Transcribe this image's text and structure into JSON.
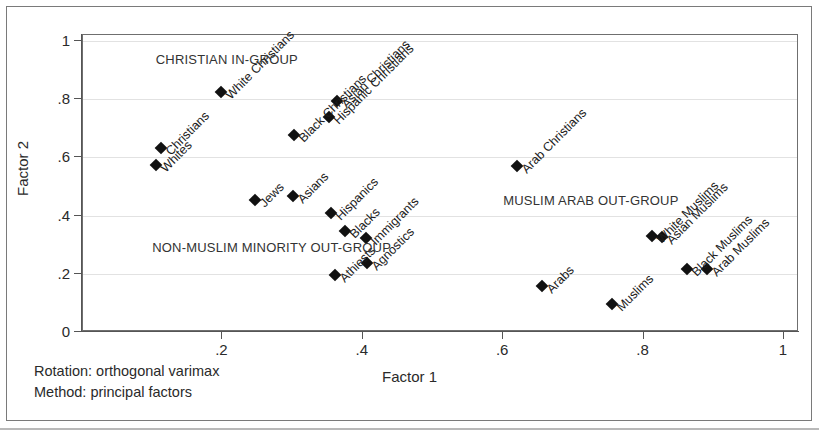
{
  "chart_data": {
    "type": "scatter",
    "title": "",
    "xlabel": "Factor 1",
    "ylabel": "Factor 2",
    "xlim": [
      0,
      1.02
    ],
    "ylim": [
      0,
      1.02
    ],
    "xticks": [
      "",
      ".2",
      ".4",
      ".6",
      ".8",
      "1"
    ],
    "xtick_values": [
      0,
      0.2,
      0.4,
      0.6,
      0.8,
      1
    ],
    "yticks": [
      "0",
      ".2",
      ".4",
      ".6",
      ".8",
      "1"
    ],
    "ytick_values": [
      0,
      0.2,
      0.4,
      0.6,
      0.8,
      1
    ],
    "grid": true,
    "legend": "none",
    "points": [
      {
        "label": "Christians",
        "x": 0.112,
        "y": 0.632
      },
      {
        "label": "Whites",
        "x": 0.105,
        "y": 0.572
      },
      {
        "label": "White Christians",
        "x": 0.198,
        "y": 0.824
      },
      {
        "label": "Black Christians",
        "x": 0.302,
        "y": 0.678
      },
      {
        "label": "Asian Christians",
        "x": 0.363,
        "y": 0.792
      },
      {
        "label": "Hispanic Christians",
        "x": 0.352,
        "y": 0.738
      },
      {
        "label": "Jews",
        "x": 0.246,
        "y": 0.455
      },
      {
        "label": "Asians",
        "x": 0.301,
        "y": 0.466
      },
      {
        "label": "Hispanics",
        "x": 0.355,
        "y": 0.408
      },
      {
        "label": "Blacks",
        "x": 0.375,
        "y": 0.348
      },
      {
        "label": "Immigrants",
        "x": 0.405,
        "y": 0.322
      },
      {
        "label": "Athiests",
        "x": 0.36,
        "y": 0.196
      },
      {
        "label": "Agnostics",
        "x": 0.406,
        "y": 0.238
      },
      {
        "label": "Arab Christians",
        "x": 0.62,
        "y": 0.57
      },
      {
        "label": "Arabs",
        "x": 0.655,
        "y": 0.158
      },
      {
        "label": "Muslims",
        "x": 0.755,
        "y": 0.095
      },
      {
        "label": "White Muslims",
        "x": 0.812,
        "y": 0.33
      },
      {
        "label": "Asian Muslims",
        "x": 0.826,
        "y": 0.327
      },
      {
        "label": "Black Muslims",
        "x": 0.862,
        "y": 0.218
      },
      {
        "label": "Arab Muslims",
        "x": 0.89,
        "y": 0.216
      }
    ],
    "annotations": [
      {
        "text": "CHRISTIAN IN-GROUP",
        "x": 0.105,
        "y": 0.935
      },
      {
        "text": "NON-MUSLIM MINORITY OUT-GROUP",
        "x": 0.1,
        "y": 0.29
      },
      {
        "text": "MUSLIM ARAB OUT-GROUP",
        "x": 0.6,
        "y": 0.45
      }
    ],
    "notes": [
      "Rotation: orthogonal varimax",
      "Method: principal factors"
    ]
  }
}
